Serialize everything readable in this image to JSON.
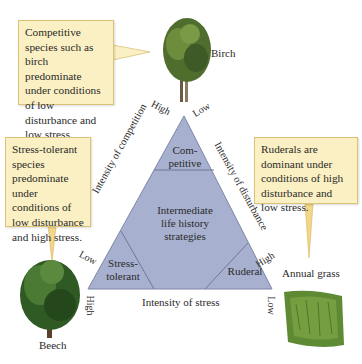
{
  "callouts": {
    "competitive": "Competitive species such as birch predominate under conditions of low disturbance and low stress.",
    "stress_tolerant": "Stress-tolerant species predominate under conditions of low disturbance and high stress.",
    "ruderal": "Ruderals are dominant under conditions of high disturbance and low stress."
  },
  "images": {
    "birch": "Birch",
    "beech": "Beech",
    "grass": "Annual grass"
  },
  "triangle": {
    "competitive": "Com-\npetitive",
    "competitive_l1": "Com-",
    "competitive_l2": "petitive",
    "intermediate_l1": "Intermediate",
    "intermediate_l2": "life history",
    "intermediate_l3": "strategies",
    "stress_l1": "Stress-",
    "stress_l2": "tolerant",
    "ruderal": "Ruderal"
  },
  "axes": {
    "competition": {
      "label": "Intensity of competition",
      "top": "High",
      "bottom": "Low"
    },
    "disturbance": {
      "label": "Intensity of disturbance",
      "top": "Low",
      "bottom": "High"
    },
    "stress": {
      "label": "Intensity of stress",
      "left": "High",
      "right": "Low"
    }
  },
  "colors": {
    "triangle_fill": "#a7b0cf",
    "triangle_stroke": "#7d86a8",
    "callout_fill": "#fbf0c3"
  }
}
